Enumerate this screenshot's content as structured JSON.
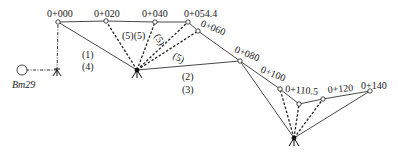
{
  "diagram": {
    "benchmark": {
      "label": "Bm29",
      "x": 22,
      "y": 70
    },
    "stations": [
      {
        "id": "S1",
        "x": 57,
        "y": 70
      },
      {
        "id": "S2",
        "x": 137,
        "y": 70
      },
      {
        "id": "S3",
        "x": 294,
        "y": 138
      }
    ],
    "points": [
      {
        "label": "0+000",
        "x": 58,
        "y": 22
      },
      {
        "label": "0+020",
        "x": 106,
        "y": 21
      },
      {
        "label": "0+040",
        "x": 155,
        "y": 22
      },
      {
        "label": "0+054.4",
        "x": 188,
        "y": 22
      },
      {
        "label": "0+060",
        "x": 198,
        "y": 31
      },
      {
        "label": "0+080",
        "x": 240,
        "y": 61
      },
      {
        "label": "0+100",
        "x": 280,
        "y": 89
      },
      {
        "label": "0+110.5",
        "x": 299,
        "y": 104
      },
      {
        "label": "0+120",
        "x": 323,
        "y": 99
      },
      {
        "label": "0+140",
        "x": 370,
        "y": 91
      }
    ],
    "annotations": {
      "a1": "(1)",
      "a4": "(4)",
      "a55": "(5)(5)",
      "a5a": "(5)",
      "a5b": "(5)",
      "a2": "(2)",
      "a3": "(3)"
    }
  }
}
